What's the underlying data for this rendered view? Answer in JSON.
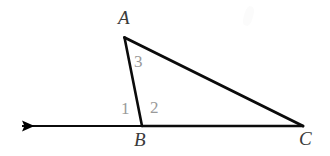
{
  "figure": {
    "name": "triangle-abc-exterior-angle",
    "background_color": "#ffffff",
    "width": 330,
    "height": 156,
    "stroke_color": "#000000",
    "vertex_label_color": "#3a3a3a",
    "angle_label_color": "#9a9a9a"
  },
  "vertices": {
    "A": {
      "label": "A",
      "x": 124,
      "y": 37
    },
    "B": {
      "label": "B",
      "x": 142,
      "y": 125
    },
    "C": {
      "label": "C",
      "x": 303,
      "y": 126
    }
  },
  "angle_labels": {
    "one": "1",
    "two": "2",
    "three": "3"
  },
  "segments": [
    {
      "name": "segment-ab",
      "from": "A",
      "to": "B"
    },
    {
      "name": "segment-ac",
      "from": "A",
      "to": "C"
    },
    {
      "name": "segment-bc",
      "from": "B",
      "to": "C"
    }
  ],
  "ray": {
    "name": "ray-from-b-leftward",
    "from_x": 142,
    "from_y": 126,
    "to_x": 12,
    "to_y": 126,
    "arrowhead": "left"
  }
}
